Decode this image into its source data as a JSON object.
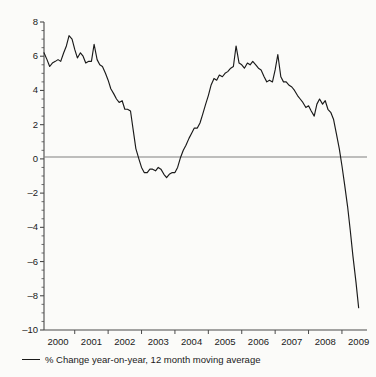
{
  "chart_data": {
    "type": "line",
    "title": "",
    "subtitle": "",
    "xlabel": "",
    "ylabel": "",
    "xlim": [
      1999.58,
      2009.25
    ],
    "ylim": [
      -10,
      8
    ],
    "grid": false,
    "legend_position": "below-axes-left",
    "zero_line": true,
    "series": [
      {
        "name": "% Change year-on-year, 12 month moving average",
        "color": "#1a1a1a",
        "x": [
          1999.58,
          1999.67,
          1999.75,
          1999.83,
          1999.92,
          2000.0,
          2000.08,
          2000.17,
          2000.25,
          2000.33,
          2000.42,
          2000.5,
          2000.58,
          2000.67,
          2000.75,
          2000.83,
          2000.92,
          2001.0,
          2001.08,
          2001.17,
          2001.25,
          2001.33,
          2001.42,
          2001.5,
          2001.58,
          2001.67,
          2001.75,
          2001.83,
          2001.92,
          2002.0,
          2002.08,
          2002.17,
          2002.25,
          2002.33,
          2002.42,
          2002.5,
          2002.58,
          2002.67,
          2002.75,
          2002.83,
          2002.92,
          2003.0,
          2003.08,
          2003.17,
          2003.25,
          2003.33,
          2003.42,
          2003.5,
          2003.58,
          2003.67,
          2003.75,
          2003.83,
          2003.92,
          2004.0,
          2004.08,
          2004.17,
          2004.25,
          2004.33,
          2004.42,
          2004.5,
          2004.58,
          2004.67,
          2004.75,
          2004.83,
          2004.92,
          2005.0,
          2005.08,
          2005.17,
          2005.25,
          2005.33,
          2005.42,
          2005.5,
          2005.58,
          2005.67,
          2005.75,
          2005.83,
          2005.92,
          2006.0,
          2006.08,
          2006.17,
          2006.25,
          2006.33,
          2006.42,
          2006.5,
          2006.58,
          2006.67,
          2006.75,
          2006.83,
          2006.92,
          2007.0,
          2007.08,
          2007.17,
          2007.25,
          2007.33,
          2007.42,
          2007.5,
          2007.58,
          2007.67,
          2007.75,
          2007.83,
          2007.92,
          2008.0,
          2008.08,
          2008.17,
          2008.25,
          2008.33,
          2008.42,
          2008.5,
          2008.58,
          2008.67,
          2008.75,
          2008.83,
          2008.92,
          2009.0
        ],
        "values": [
          6.2,
          5.8,
          5.4,
          5.6,
          5.7,
          5.8,
          5.7,
          6.2,
          6.6,
          7.2,
          7.0,
          6.4,
          5.9,
          6.2,
          6.0,
          5.6,
          5.7,
          5.7,
          6.7,
          5.8,
          5.5,
          5.4,
          5.0,
          4.6,
          4.1,
          3.8,
          3.5,
          3.3,
          3.4,
          2.9,
          2.9,
          2.8,
          1.7,
          0.6,
          0.0,
          -0.5,
          -0.8,
          -0.8,
          -0.6,
          -0.6,
          -0.7,
          -0.5,
          -0.6,
          -0.9,
          -1.1,
          -0.9,
          -0.8,
          -0.8,
          -0.5,
          0.1,
          0.5,
          0.8,
          1.2,
          1.5,
          1.8,
          1.8,
          2.1,
          2.6,
          3.2,
          3.7,
          4.3,
          4.7,
          4.6,
          4.9,
          4.8,
          5.0,
          5.1,
          5.3,
          5.4,
          6.6,
          5.6,
          5.5,
          5.3,
          5.6,
          5.5,
          5.7,
          5.5,
          5.3,
          5.2,
          4.8,
          4.5,
          4.6,
          4.5,
          5.2,
          6.1,
          4.8,
          4.5,
          4.5,
          4.3,
          4.2,
          4.0,
          3.7,
          3.5,
          3.3,
          3.0,
          3.1,
          2.8,
          2.5,
          3.2,
          3.5,
          3.2,
          3.4,
          2.9,
          2.7,
          2.3,
          1.5,
          0.6,
          -0.4,
          -1.5,
          -2.8,
          -4.2,
          -5.7,
          -7.2,
          -8.7
        ]
      }
    ],
    "yticks": [
      8,
      6,
      4,
      2,
      0,
      -2,
      -4,
      -6,
      -8,
      -10
    ],
    "ytick_labels": [
      "8",
      "6",
      "4",
      "2",
      "0",
      "–2",
      "–4",
      "–6",
      "–8",
      "–10"
    ],
    "yminor_step": 0.5,
    "xticks": [
      2000,
      2001,
      2002,
      2003,
      2004,
      2005,
      2006,
      2007,
      2008,
      2009
    ],
    "xtick_labels": [
      "2000",
      "2001",
      "2002",
      "2003",
      "2004",
      "2005",
      "2006",
      "2007",
      "2008",
      "2009"
    ]
  },
  "legend": {
    "entries": [
      {
        "label": "% Change year-on-year, 12 month moving average",
        "color": "#1a1a1a"
      }
    ]
  },
  "colors": {
    "background": "#fbfbf9",
    "line": "#1a1a1a",
    "axis": "#4a4a4a",
    "zero_line": "#808080",
    "text": "#1a1a1a"
  }
}
